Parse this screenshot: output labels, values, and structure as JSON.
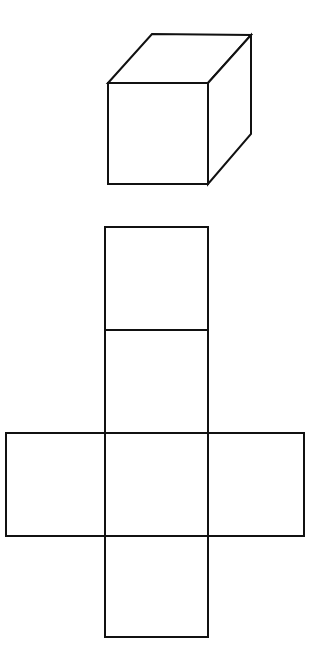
{
  "figure": {
    "background_color": "#ffffff",
    "stroke_color": "#111111",
    "stroke_width": 2,
    "canvas": {
      "width": 323,
      "height": 649
    }
  },
  "cube": {
    "label": "cube-solid",
    "projection": "oblique",
    "front_face": {
      "label": "front-face",
      "x": 108,
      "y": 83,
      "width": 100,
      "height": 101,
      "points": "108,83 208,83 208,184 108,184"
    },
    "top_face": {
      "label": "top-face",
      "points": "108,83 152,34 251,35 208,83"
    },
    "right_face": {
      "label": "right-face",
      "points": "208,83 251,35 251,134 208,184"
    },
    "depth_offset": {
      "dx": 43,
      "dy": -49
    }
  },
  "net": {
    "label": "cube-net",
    "shape": "cross",
    "column": {
      "x_left": 105,
      "x_right": 208,
      "width": 103
    },
    "band": {
      "x_left": 6,
      "x_right": 304,
      "y_top": 433,
      "y_bottom": 536,
      "height": 103
    },
    "squares": [
      {
        "name": "net-square-top",
        "x": 105,
        "y": 227,
        "width": 103,
        "height": 103
      },
      {
        "name": "net-square-upper-middle",
        "x": 105,
        "y": 330,
        "width": 103,
        "height": 103
      },
      {
        "name": "net-square-left",
        "x": 6,
        "y": 433,
        "width": 99,
        "height": 103
      },
      {
        "name": "net-square-center",
        "x": 105,
        "y": 433,
        "width": 103,
        "height": 103
      },
      {
        "name": "net-square-right",
        "x": 208,
        "y": 433,
        "width": 96,
        "height": 103
      },
      {
        "name": "net-square-bottom",
        "x": 105,
        "y": 536,
        "width": 103,
        "height": 101
      }
    ],
    "outline_path": "M105,227 L208,227 L208,433 L304,433 L304,536 L208,536 L208,637 L105,637 L105,536 L6,536 L6,433 L105,433 Z",
    "internal_lines": [
      {
        "name": "divider-top",
        "x1": 105,
        "y1": 330,
        "x2": 208,
        "y2": 330
      },
      {
        "name": "divider-band-top",
        "x1": 105,
        "y1": 433,
        "x2": 208,
        "y2": 433
      },
      {
        "name": "divider-band-bottom",
        "x1": 105,
        "y1": 536,
        "x2": 208,
        "y2": 536
      },
      {
        "name": "divider-column-left",
        "x1": 105,
        "y1": 433,
        "x2": 105,
        "y2": 536
      },
      {
        "name": "divider-column-right",
        "x1": 208,
        "y1": 433,
        "x2": 208,
        "y2": 536
      }
    ]
  }
}
